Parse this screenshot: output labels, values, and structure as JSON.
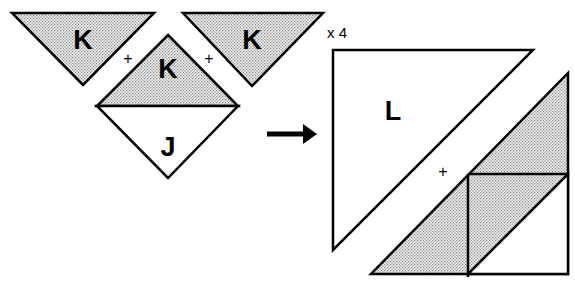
{
  "diagram": {
    "colors": {
      "stroke": "#000000",
      "shade": "#d4d4d4",
      "background": "#ffffff"
    },
    "left_group": {
      "triangle_left_label": "K",
      "triangle_right_label": "K",
      "diamond_top_label": "K",
      "diamond_bottom_label": "J",
      "plus_left": "+",
      "plus_right": "+"
    },
    "arrow": {
      "direction": "right"
    },
    "right_group": {
      "multiplier": "x 4",
      "large_triangle_label": "L",
      "plus": "+"
    }
  }
}
